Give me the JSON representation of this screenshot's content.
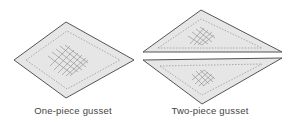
{
  "figure": {
    "panels": [
      {
        "id": "one-piece",
        "caption": "One-piece gusset"
      },
      {
        "id": "two-piece",
        "caption": "Two-piece gusset"
      }
    ]
  },
  "colors": {
    "fill": "#e6e6e6",
    "outline": "#555555",
    "stitch": "#9a9a9a",
    "hatch": "#8a8a8a",
    "text": "#444444"
  }
}
